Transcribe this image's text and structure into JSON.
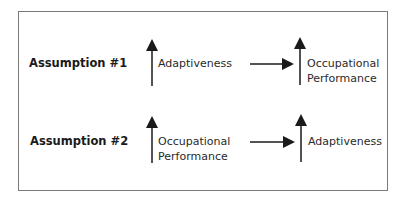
{
  "diagram": {
    "rows": [
      {
        "label": "Assumption #1",
        "from": {
          "direction": "up",
          "text_line1": "Adaptiveness",
          "text_line2": ""
        },
        "to": {
          "direction": "up",
          "text_line1": "Occupational",
          "text_line2": "Performance"
        }
      },
      {
        "label": "Assumption #2",
        "from": {
          "direction": "up",
          "text_line1": "Occupational",
          "text_line2": "Performance"
        },
        "to": {
          "direction": "up",
          "text_line1": "Adaptiveness",
          "text_line2": ""
        }
      }
    ],
    "colors": {
      "border": "#7a7a7a",
      "ink": "#1a1a1a"
    }
  }
}
